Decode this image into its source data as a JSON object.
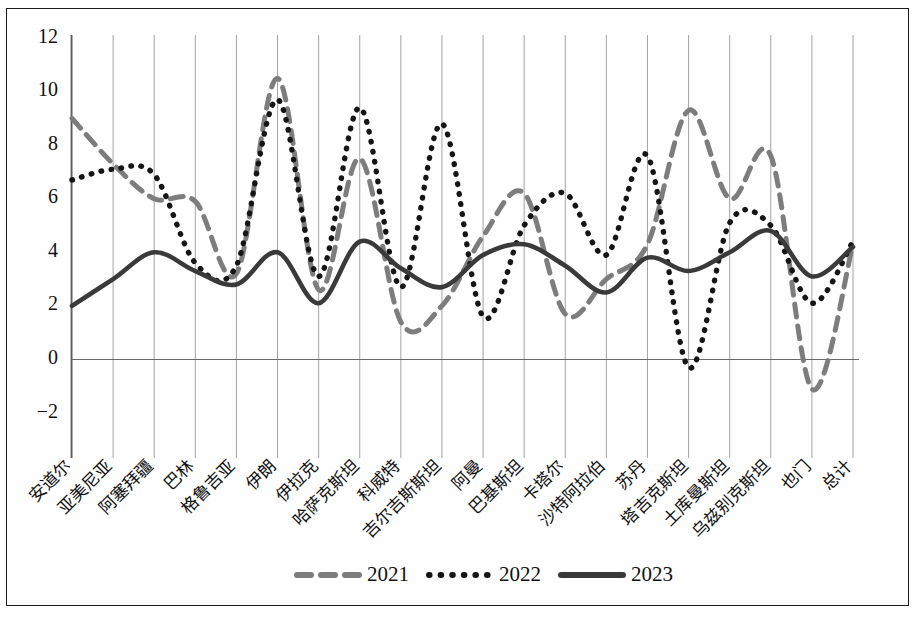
{
  "chart_data": {
    "type": "line",
    "title": "",
    "xlabel": "",
    "ylabel": "",
    "ylim": [
      -2,
      12
    ],
    "yticks": [
      -2,
      0,
      2,
      4,
      6,
      8,
      10,
      12
    ],
    "ytick_labels": [
      "−2",
      "0",
      "2",
      "4",
      "6",
      "8",
      "10",
      "12"
    ],
    "grid": "vertical",
    "legend_position": "bottom-center",
    "smoothing": "spline",
    "categories": [
      "安道尔",
      "亚美尼亚",
      "阿塞拜疆",
      "巴林",
      "格鲁吉亚",
      "伊朗",
      "伊拉克",
      "哈萨克斯坦",
      "科威特",
      "吉尔吉斯斯坦",
      "阿曼",
      "巴基斯坦",
      "卡塔尔",
      "沙特阿拉伯",
      "苏丹",
      "塔吉克斯坦",
      "土库曼斯坦",
      "乌兹别克斯坦",
      "也门",
      "总计"
    ],
    "series": [
      {
        "name": "2021",
        "style": "dashed",
        "color": "#7d7d7d",
        "values": [
          9.0,
          7.3,
          6.0,
          5.9,
          3.2,
          10.5,
          2.6,
          7.5,
          1.4,
          2.0,
          4.6,
          6.2,
          1.7,
          3.0,
          4.3,
          9.3,
          6.0,
          7.6,
          -1.1,
          4.3
        ]
      },
      {
        "name": "2022",
        "style": "dotted",
        "color": "#151515",
        "values": [
          6.7,
          7.1,
          6.9,
          3.6,
          3.5,
          9.7,
          3.1,
          9.4,
          2.7,
          8.8,
          1.6,
          5.0,
          6.2,
          3.9,
          7.6,
          -0.3,
          5.1,
          5.0,
          2.1,
          4.4
        ]
      },
      {
        "name": "2023",
        "style": "solid",
        "color": "#3a3a3a",
        "values": [
          2.0,
          3.0,
          4.0,
          3.3,
          2.8,
          4.0,
          2.1,
          4.4,
          3.4,
          2.7,
          3.9,
          4.3,
          3.5,
          2.5,
          3.8,
          3.3,
          4.0,
          4.8,
          3.1,
          4.2
        ]
      }
    ]
  },
  "legend": {
    "items": [
      {
        "label": "2021",
        "marker": "dashed-line"
      },
      {
        "label": "2022",
        "marker": "dotted-line"
      },
      {
        "label": "2023",
        "marker": "solid-line"
      }
    ]
  },
  "plot_geometry": {
    "left": 65,
    "right": 846,
    "top": 29,
    "bottom": 404
  }
}
